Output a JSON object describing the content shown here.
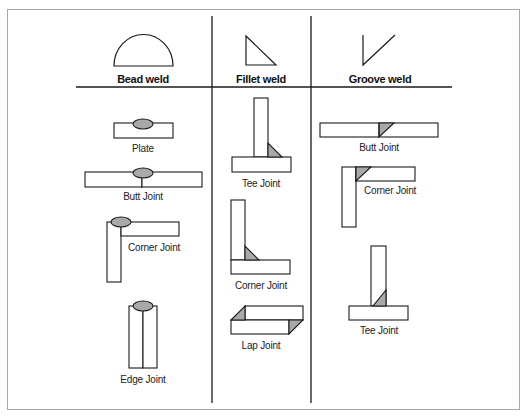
{
  "colors": {
    "line": "#1a1a1a",
    "weld_fill": "#a9a9a9",
    "frame": "#a8a8a8",
    "background": "#ffffff"
  },
  "columns": [
    {
      "header": "Bead weld",
      "symbol": "semicircle",
      "joints": [
        {
          "label": "Plate"
        },
        {
          "label": "Butt Joint"
        },
        {
          "label": "Corner Joint"
        },
        {
          "label": "Edge Joint"
        }
      ]
    },
    {
      "header": "Fillet weld",
      "symbol": "right-triangle",
      "joints": [
        {
          "label": "Tee Joint"
        },
        {
          "label": "Corner Joint"
        },
        {
          "label": "Lap Joint"
        }
      ]
    },
    {
      "header": "Groove weld",
      "symbol": "bevel-v",
      "joints": [
        {
          "label": "Butt Joint"
        },
        {
          "label": "Corner Joint"
        },
        {
          "label": "Tee Joint"
        }
      ]
    }
  ]
}
